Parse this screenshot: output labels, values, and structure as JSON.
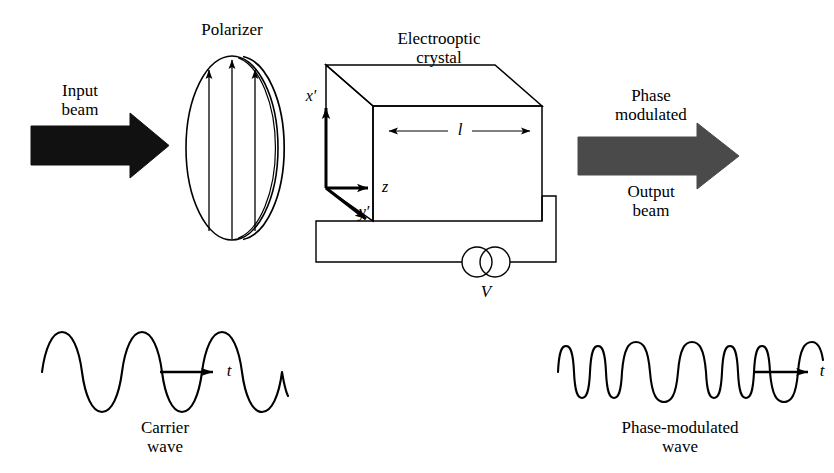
{
  "figure": {
    "background": "#ffffff",
    "ink": "#000000",
    "beam_black": "#111111",
    "beam_gray": "#4a4a4a"
  },
  "labels": {
    "polarizer": "Polarizer",
    "crystal_line1": "Electrooptic",
    "crystal_line2": "crystal",
    "input_line1": "Input",
    "input_line2": "beam",
    "output_line1": "Phase",
    "output_line2": "modulated",
    "output_line3": "Output",
    "output_line4": "beam",
    "axis_x": "x′",
    "axis_y": "y′",
    "axis_z": "z",
    "length": "l",
    "voltage": "V",
    "time_left": "t",
    "time_right": "t",
    "carrier_line1": "Carrier",
    "carrier_line2": "wave",
    "modulated_line1": "Phase-modulated",
    "modulated_line2": "wave"
  },
  "chart_data": {
    "type": "line",
    "xlabel": "t",
    "ylabel": "",
    "grid": false,
    "legend": "none",
    "series": [
      {
        "name": "Carrier wave",
        "description": "Uniform-frequency sinusoid, 4 cycles of constant period",
        "cycles": 4,
        "amplitude": 1.0,
        "period_pattern": [
          1,
          1,
          1,
          1
        ],
        "x_start_px": 42,
        "x_end_px": 288,
        "y_center_px": 372,
        "amplitude_px": 26
      },
      {
        "name": "Phase-modulated wave",
        "description": "Sinusoid with time-varying period: compressed and expanded cycles",
        "cycles": 8,
        "amplitude": 1.0,
        "period_pattern": [
          0.62,
          0.62,
          1.25,
          1.25,
          0.68,
          0.68,
          0.68,
          1.22
        ],
        "x_start_px": 558,
        "x_end_px": 738,
        "y_center_px": 372,
        "amplitude_px": 26
      }
    ]
  },
  "components": {
    "polarizer": {
      "shape": "ellipse-with-offset-arc",
      "center_x": 232,
      "center_y": 148,
      "rx": 46,
      "ry": 92,
      "transmission_arrows": 3
    },
    "crystal": {
      "shape": "parallelepiped",
      "front_left_x": 373,
      "front_right_x": 542,
      "front_top_y": 106,
      "front_bottom_y": 221,
      "depth_dx": -47,
      "depth_dy": -41
    },
    "source": {
      "symbol": "ac-source-double-circle",
      "cx1": 477,
      "cx2": 495,
      "cy": 262,
      "r": 15
    }
  }
}
